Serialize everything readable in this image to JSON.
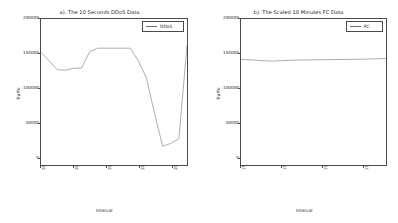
{
  "figure": {
    "width": 398,
    "height": 223,
    "background": "#ffffff",
    "line_color": "#6d6d6d",
    "axis_color": "#4a4a4a",
    "text_color": "#1a1a1a"
  },
  "chart_data": [
    {
      "type": "line",
      "panel": "a",
      "title": "a). The 10 Seconds DDoS Data",
      "xlabel": "Interval",
      "ylabel": "Traffic",
      "legend": [
        "DDoS"
      ],
      "legend_position": "upper right",
      "grid": false,
      "ylim": [
        0,
        210000
      ],
      "yticks": [
        0,
        50000,
        100000,
        150000,
        200000
      ],
      "ytick_labels": [
        "0",
        "50000",
        "100000",
        "150000",
        "200000"
      ],
      "xtick_labels": [
        "2007-08-05 05:34:00",
        "2007-08-05 05:34:02",
        "2007-08-05 05:34:04",
        "2007-08-05 05:34:06",
        "2007-08-05 05:34:08"
      ],
      "xtick_positions": [
        0,
        4,
        8,
        12,
        16
      ],
      "xlim": [
        0,
        18
      ],
      "x": [
        0,
        1,
        2,
        3,
        4,
        5,
        6,
        7,
        8,
        9,
        10,
        11,
        12,
        13,
        14,
        15,
        16,
        17,
        18
      ],
      "series": [
        {
          "name": "DDoS",
          "color": "#6d6d6d",
          "values": [
            162000,
            150000,
            137000,
            136500,
            139000,
            139500,
            163000,
            168000,
            168000,
            168000,
            168000,
            168000,
            150000,
            125000,
            74000,
            27000,
            31000,
            38000,
            172000
          ]
        }
      ]
    },
    {
      "type": "line",
      "panel": "b",
      "title": "b). The Scaled 10 Minutes FC Data",
      "xlabel": "Interval",
      "ylabel": "Traffic",
      "legend": [
        "FC"
      ],
      "legend_position": "upper right",
      "grid": false,
      "ylim": [
        0,
        210000
      ],
      "yticks": [
        0,
        50000,
        100000,
        150000,
        200000
      ],
      "ytick_labels": [
        "0",
        "50000",
        "100000",
        "150000",
        "200000"
      ],
      "xtick_labels": [
        "1998-7-03 16:00:00",
        "1998-7-03 16:02:40",
        "1998-7-03 16:05:20",
        "1998-7-03 16:08:00"
      ],
      "xtick_positions": [
        0,
        5,
        10,
        15
      ],
      "xlim": [
        0,
        18
      ],
      "x": [
        0,
        1,
        2,
        3,
        4,
        5,
        6,
        7,
        8,
        9,
        10,
        11,
        12,
        13,
        14,
        15,
        16,
        17,
        18
      ],
      "series": [
        {
          "name": "FC",
          "color": "#6d6d6d",
          "values": [
            152000,
            151500,
            150500,
            149800,
            149500,
            150000,
            150600,
            151000,
            151200,
            151300,
            151500,
            151600,
            151700,
            151800,
            152000,
            152200,
            152500,
            152800,
            153200
          ]
        }
      ]
    }
  ]
}
